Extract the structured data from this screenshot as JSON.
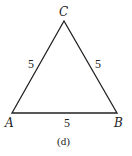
{
  "figure": {
    "caption": "(d)",
    "vertices": {
      "A": {
        "label": "A",
        "x": 12,
        "y": 113
      },
      "B": {
        "label": "B",
        "x": 117,
        "y": 113
      },
      "C": {
        "label": "C",
        "x": 64,
        "y": 21
      }
    },
    "sides": {
      "AC": "5",
      "CB": "5",
      "AB": "5"
    },
    "stroke_color": "#222222"
  }
}
